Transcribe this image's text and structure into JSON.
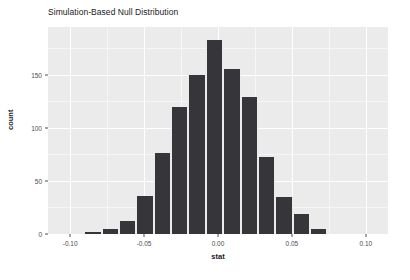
{
  "chart_data": {
    "type": "bar",
    "title": "Simulation-Based Null Distribution",
    "xlabel": "stat",
    "ylabel": "count",
    "xlim": [
      -0.115,
      0.115
    ],
    "ylim": [
      0,
      195
    ],
    "grid": true,
    "legend": null,
    "bin_width": 0.01175,
    "bin_starts": [
      -0.0905,
      -0.07875,
      -0.067,
      -0.05525,
      -0.0435,
      -0.03175,
      -0.02,
      -0.00825,
      0.0035,
      0.01525,
      0.027,
      0.03875,
      0.0505,
      0.06225
    ],
    "bin_centers": [
      -0.08463,
      -0.07288,
      -0.06113,
      -0.04938,
      -0.03763,
      -0.02588,
      -0.01413,
      -0.00238,
      0.00938,
      0.02113,
      0.03288,
      0.04463,
      0.05638,
      0.06813
    ],
    "categories": [
      "-0.0846",
      "-0.0729",
      "-0.0611",
      "-0.0494",
      "-0.0376",
      "-0.0259",
      "-0.0141",
      "-0.0024",
      "0.0094",
      "0.0211",
      "0.0329",
      "0.0446",
      "0.0564",
      "0.0681"
    ],
    "values": [
      2,
      5,
      12,
      36,
      76,
      120,
      150,
      183,
      155,
      129,
      73,
      35,
      19,
      5
    ],
    "x_ticks": [
      -0.1,
      -0.05,
      0.0,
      0.05,
      0.1
    ],
    "x_tick_labels": [
      "-0.10",
      "-0.05",
      "0.00",
      "0.05",
      "0.10"
    ],
    "y_ticks": [
      0,
      50,
      100,
      150
    ],
    "y_tick_labels": [
      "0",
      "50",
      "100",
      "150"
    ],
    "y_minor_ticks": [
      25,
      75,
      125,
      175
    ],
    "x_minor_ticks": [
      -0.075,
      -0.025,
      0.025,
      0.075
    ],
    "colors": {
      "bar_fill": "#35353a",
      "panel_background": "#ebebeb",
      "grid_line": "#ffffff",
      "text": "#1a1a1a",
      "tick_text": "#4d4d4d"
    }
  }
}
